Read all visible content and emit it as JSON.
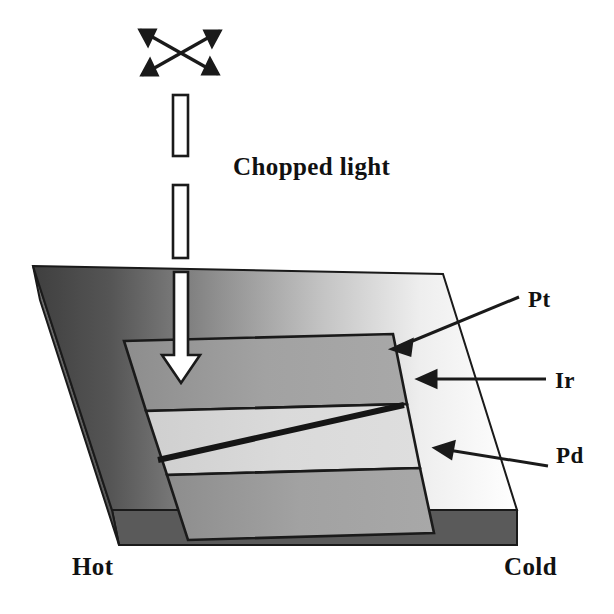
{
  "figure": {
    "background_color": "#ffffff",
    "width": 614,
    "height": 614
  },
  "labels": {
    "chopped_light": "Chopped light",
    "pt": "Pt",
    "ir": "Ir",
    "pd": "Pd",
    "hot": "Hot",
    "cold": "Cold"
  },
  "colors": {
    "outline": "#1a1a1a",
    "band_dark": "#9e9e9e",
    "band_light": "#d8d8d8",
    "slab_front_face": "#5a5a5a",
    "slab_side_face": "#6b6b6b",
    "gradient_hot": "#4a4a4a",
    "gradient_cold": "#ffffff",
    "arrow_fill": "#ffffff",
    "text": "#111111"
  },
  "elements": {
    "crossed_arrows": {
      "name": "crossed-double-arrows",
      "count": 2,
      "description": "two crossed double-headed arrows indicating incident light"
    },
    "chopper_bars": {
      "name": "chopper-blades",
      "count": 2,
      "description": "two hollow vertical rectangles representing the optical chopper blades"
    },
    "beam_arrow": {
      "name": "light-beam-arrow",
      "direction": "down",
      "description": "white downward arrow representing the chopped light beam striking the sample"
    },
    "stripes": [
      {
        "id": "pt",
        "label": "Pt",
        "tone": "dark"
      },
      {
        "id": "ir",
        "label": "Ir",
        "tone": "light"
      },
      {
        "id": "pd",
        "label": "Pd",
        "tone": "dark"
      }
    ],
    "diagonal_line": {
      "name": "diagonal-junction-line",
      "description": "thick diagonal line crossing the middle Ir stripe from lower-left to upper-right"
    },
    "temperature_gradient": {
      "left_end": "Hot",
      "right_end": "Cold",
      "description": "substrate top surface shaded from dark at the hot end to white at the cold end"
    }
  }
}
